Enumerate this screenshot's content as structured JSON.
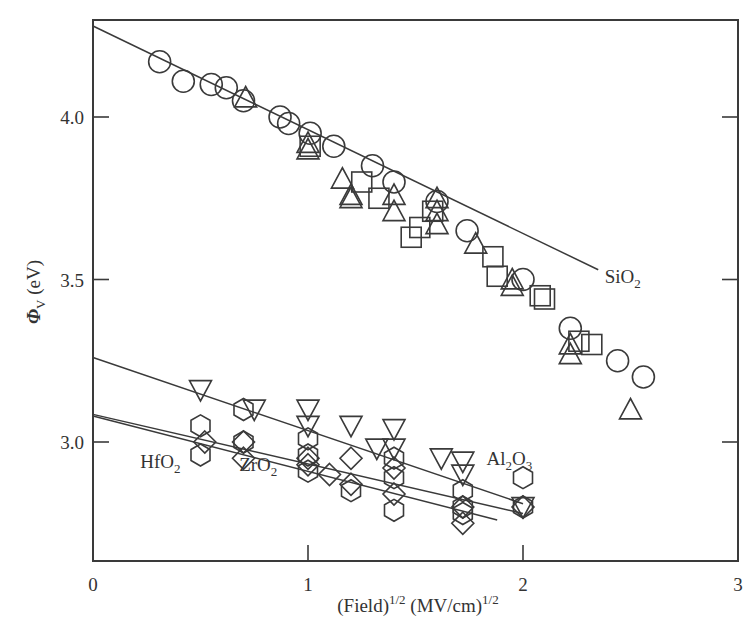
{
  "chart_data": {
    "type": "scatter",
    "title": "",
    "xlabel": "(Field)^1/2 (MV/cm)^1/2",
    "xlabel_parts": {
      "base": "(Field)",
      "sup1": "1/2",
      "mid": " (MV/cm)",
      "sup2": "1/2"
    },
    "ylabel": "ΦV (eV)",
    "ylabel_parts": {
      "phi": "Φ",
      "sub": "V",
      "unit": " (eV)"
    },
    "xlim": [
      0,
      3
    ],
    "ylim": [
      2.72,
      4.3
    ],
    "x_ticks": [
      0,
      1,
      2,
      3
    ],
    "x_tick_labels": [
      "0",
      "1",
      "2",
      "3"
    ],
    "y_ticks": [
      3.0,
      3.5,
      4.0
    ],
    "y_tick_labels": [
      "3.0",
      "3.5",
      "4.0"
    ],
    "grid": false,
    "legend": "none (inline annotations)",
    "annotations": [
      {
        "text": "SiO",
        "sub": "2",
        "x": 2.38,
        "y": 3.49
      },
      {
        "text": "Al",
        "sub": "2",
        "text2": "O",
        "sub2": "3",
        "x": 1.83,
        "y": 2.93
      },
      {
        "text": "HfO",
        "sub": "2",
        "x": 0.22,
        "y": 2.92
      },
      {
        "text": "ZrO",
        "sub": "2",
        "x": 0.68,
        "y": 2.91
      }
    ],
    "fit_lines": [
      {
        "name": "SiO2",
        "x": [
          0,
          2.35
        ],
        "y": [
          4.28,
          3.53
        ]
      },
      {
        "name": "Al2O3",
        "x": [
          0,
          2.0
        ],
        "y": [
          3.26,
          2.81
        ]
      },
      {
        "name": "HfO2",
        "x": [
          0,
          2.0
        ],
        "y": [
          3.085,
          2.78
        ]
      },
      {
        "name": "ZrO2",
        "x": [
          0,
          1.88
        ],
        "y": [
          3.08,
          2.76
        ]
      }
    ],
    "series": [
      {
        "name": "SiO2 (circle)",
        "marker": "circle",
        "x": [
          0.31,
          0.42,
          0.55,
          0.62,
          0.7,
          0.87,
          0.91,
          1.01,
          1.12,
          1.3,
          1.4,
          1.6,
          1.74,
          2.0,
          2.22,
          2.44,
          2.56
        ],
        "y": [
          4.17,
          4.11,
          4.1,
          4.09,
          4.05,
          4.0,
          3.98,
          3.95,
          3.91,
          3.85,
          3.8,
          3.74,
          3.65,
          3.5,
          3.35,
          3.25,
          3.2
        ]
      },
      {
        "name": "SiO2 (triangle)",
        "marker": "triangle-up",
        "x": [
          0.71,
          1.0,
          1.0,
          1.16,
          1.2,
          1.2,
          1.4,
          1.4,
          1.6,
          1.6,
          1.6,
          1.78,
          1.95,
          1.95,
          2.22,
          2.22,
          2.5
        ],
        "y": [
          4.06,
          3.92,
          3.9,
          3.81,
          3.76,
          3.75,
          3.76,
          3.71,
          3.75,
          3.71,
          3.67,
          3.61,
          3.5,
          3.48,
          3.3,
          3.27,
          3.1
        ]
      },
      {
        "name": "SiO2 (square)",
        "marker": "square",
        "x": [
          1.01,
          1.25,
          1.33,
          1.48,
          1.52,
          1.58,
          1.86,
          1.88,
          2.08,
          2.1,
          2.26,
          2.32
        ],
        "y": [
          3.91,
          3.8,
          3.75,
          3.63,
          3.66,
          3.71,
          3.57,
          3.51,
          3.45,
          3.44,
          3.31,
          3.3
        ]
      },
      {
        "name": "Al2O3",
        "marker": "triangle-down",
        "x": [
          0.5,
          0.75,
          1.0,
          1.0,
          1.2,
          1.4,
          1.4,
          1.72,
          1.72,
          2.0
        ],
        "y": [
          3.16,
          3.1,
          3.1,
          3.05,
          3.05,
          3.04,
          2.98,
          2.94,
          2.9,
          2.8
        ],
        "x2": [
          1.32,
          1.62
        ],
        "y2": [
          2.98,
          2.95
        ]
      },
      {
        "name": "HfO2",
        "marker": "hexagon",
        "x": [
          0.5,
          0.5,
          0.7,
          0.7,
          1.0,
          1.0,
          1.0,
          1.2,
          1.4,
          1.4,
          1.4,
          1.72,
          1.72,
          1.72,
          2.0,
          2.0
        ],
        "y": [
          3.05,
          2.96,
          3.1,
          3.0,
          3.01,
          2.96,
          2.91,
          2.85,
          2.95,
          2.89,
          2.79,
          2.85,
          2.8,
          2.78,
          2.89,
          2.8
        ]
      },
      {
        "name": "ZrO2",
        "marker": "diamond",
        "x": [
          0.52,
          0.7,
          0.7,
          1.0,
          1.0,
          1.1,
          1.2,
          1.2,
          1.4,
          1.4,
          1.72,
          1.72,
          2.0
        ],
        "y": [
          3.0,
          3.0,
          2.95,
          2.95,
          2.93,
          2.9,
          2.95,
          2.87,
          2.92,
          2.84,
          2.8,
          2.75,
          2.8
        ]
      }
    ]
  }
}
